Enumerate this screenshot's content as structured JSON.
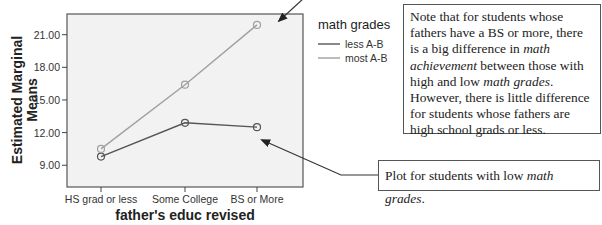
{
  "chart_data": {
    "type": "line",
    "title": "",
    "xlabel": "father's educ revised",
    "ylabel": "Estimated Marginal Means",
    "categories": [
      "HS grad or less",
      "Some College",
      "BS or More"
    ],
    "series": [
      {
        "name": "less A-B",
        "values": [
          9.8,
          12.9,
          12.5
        ],
        "color": "#555555"
      },
      {
        "name": "most A-B",
        "values": [
          10.5,
          16.4,
          21.9
        ],
        "color": "#a0a0a0"
      }
    ],
    "yticks": [
      "9.00",
      "12.00",
      "15.00",
      "18.00",
      "21.00"
    ],
    "ytick_values": [
      9,
      12,
      15,
      18,
      21
    ],
    "ylim": [
      7.0,
      22.9
    ],
    "grid": false,
    "legend": {
      "title": "math grades",
      "position": "right"
    },
    "plot_background": "#f2f2f2"
  },
  "annotations": {
    "main_note": {
      "t1": "Note that for students whose fathers have a BS or more, there is a big difference in ",
      "i1": "math achievement",
      "t2": " between those with high and low ",
      "i2": "math grades",
      "t3": ". However, there is little difference for students whose fathers are high school grads or less."
    },
    "low_note": {
      "t1": "Plot for students with low ",
      "i1": "math grades",
      "t2": "."
    }
  }
}
